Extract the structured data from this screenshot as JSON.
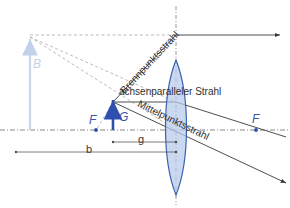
{
  "diagram": {
    "language": "de",
    "colors": {
      "lens_fill": "#adc3e8",
      "lens_stroke": "#3b62b0",
      "object_arrow": "#2f4faf",
      "image_arrow": "#c3d2ea",
      "ray_line": "#3a3a3a",
      "construction_dash": "#9a9a9a",
      "axis": "#6a6a6a",
      "focal_label": "#3b52a4",
      "background": "#ffffff"
    }
  },
  "labels": {
    "ray_parallel": "achsenparalleler Strahl",
    "ray_focal": "Brennpunktsstrahl",
    "ray_center": "Mittelpunktsstrahl",
    "focal_left": "F",
    "focal_right": "F",
    "object_height": "G",
    "image_height": "B",
    "image_distance": "b",
    "object_distance": "g"
  },
  "geometry": {
    "optical_axis_y": 130,
    "lens_center_x": 176,
    "lens_top_y": 60,
    "lens_bottom_y": 195,
    "lens_half_width": 14,
    "object_x": 113,
    "object_top_y": 102,
    "image_x": 30,
    "image_top_y": 37,
    "focal_left_x": 96,
    "focal_right_x": 256,
    "parallel_ray_y": 102,
    "exit_ray_y": 35
  },
  "dimensions": {
    "b_label": "b",
    "b_start_x": 16,
    "b_end_x": 176,
    "b_y": 152,
    "g_label": "g",
    "g_start_x": 113,
    "g_end_x": 176,
    "g_y": 142
  }
}
